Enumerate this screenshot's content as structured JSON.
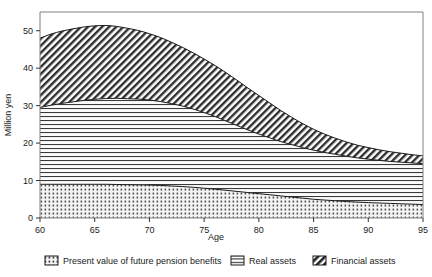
{
  "chart_data": {
    "type": "area",
    "title": "",
    "subtitle": "",
    "xlabel": "Age",
    "ylabel": "Million yen",
    "xlim": [
      60,
      95
    ],
    "ylim": [
      0,
      55
    ],
    "xticks": [
      60,
      65,
      70,
      75,
      80,
      85,
      90,
      95
    ],
    "yticks": [
      0,
      10,
      20,
      30,
      40,
      50
    ],
    "grid": false,
    "legend_position": "bottom",
    "stacked": true,
    "x": [
      60,
      61,
      62,
      63,
      64,
      65,
      66,
      67,
      68,
      69,
      70,
      71,
      72,
      73,
      74,
      75,
      76,
      77,
      78,
      79,
      80,
      81,
      82,
      83,
      84,
      85,
      86,
      87,
      88,
      89,
      90,
      91,
      92,
      93,
      94,
      95
    ],
    "series": [
      {
        "name": "Present value of future pension benefits",
        "pattern": "dots",
        "values": [
          9.0,
          9.0,
          9.0,
          9.0,
          9.0,
          9.0,
          9.0,
          8.95,
          8.9,
          8.85,
          8.8,
          8.7,
          8.55,
          8.4,
          8.2,
          7.95,
          7.7,
          7.4,
          7.1,
          6.8,
          6.5,
          6.2,
          5.9,
          5.6,
          5.3,
          5.0,
          4.8,
          4.6,
          4.4,
          4.25,
          4.1,
          4.0,
          3.9,
          3.8,
          3.7,
          3.6
        ]
      },
      {
        "name": "Real assets",
        "pattern": "horizontal-lines",
        "values": [
          20.5,
          21.1,
          21.6,
          22.0,
          22.4,
          22.7,
          22.9,
          23.0,
          22.95,
          22.9,
          22.7,
          22.4,
          22.0,
          21.5,
          20.9,
          20.2,
          19.4,
          18.5,
          17.6,
          16.7,
          15.9,
          15.2,
          14.5,
          14.0,
          13.5,
          13.1,
          12.7,
          12.4,
          12.1,
          11.8,
          11.6,
          11.4,
          11.2,
          11.1,
          11.0,
          10.9
        ]
      },
      {
        "name": "Financial assets",
        "pattern": "diagonal-hatch",
        "values": [
          18.5,
          19.0,
          19.3,
          19.5,
          19.6,
          19.6,
          19.5,
          19.2,
          18.8,
          18.3,
          17.7,
          17.1,
          16.4,
          15.7,
          15.0,
          14.3,
          13.6,
          12.9,
          12.1,
          11.2,
          10.3,
          9.3,
          8.3,
          7.3,
          6.4,
          5.6,
          4.9,
          4.3,
          3.8,
          3.4,
          3.1,
          2.8,
          2.6,
          2.4,
          2.2,
          2.1
        ]
      }
    ],
    "cumulative_top_values": {
      "pension_top": [
        9.0,
        9.0,
        9.0,
        9.0,
        9.0,
        9.0,
        9.0,
        8.95,
        8.9,
        8.85,
        8.8,
        8.7,
        8.55,
        8.4,
        8.2,
        7.95,
        7.7,
        7.4,
        7.1,
        6.8,
        6.5,
        6.2,
        5.9,
        5.6,
        5.3,
        5.0,
        4.8,
        4.6,
        4.4,
        4.25,
        4.1,
        4.0,
        3.9,
        3.8,
        3.7,
        3.6
      ],
      "real_top": [
        29.5,
        30.1,
        30.6,
        31.0,
        31.4,
        31.7,
        31.9,
        31.95,
        31.85,
        31.75,
        31.5,
        31.1,
        30.55,
        29.9,
        29.1,
        28.15,
        27.1,
        25.9,
        24.7,
        23.5,
        22.4,
        21.4,
        20.4,
        19.6,
        18.8,
        18.1,
        17.5,
        17.0,
        16.5,
        16.05,
        15.7,
        15.4,
        15.1,
        14.9,
        14.7,
        14.5
      ],
      "financial_top": [
        48.0,
        49.1,
        49.9,
        50.5,
        51.0,
        51.3,
        51.4,
        51.15,
        50.65,
        50.05,
        49.2,
        48.2,
        46.95,
        45.6,
        44.1,
        42.45,
        40.7,
        38.8,
        36.8,
        34.7,
        32.7,
        30.7,
        28.7,
        26.9,
        25.2,
        23.7,
        22.4,
        21.3,
        20.3,
        19.45,
        18.8,
        18.2,
        17.7,
        17.3,
        16.9,
        16.6
      ]
    }
  },
  "axes": {
    "y_label": "Million yen",
    "x_label": "Age",
    "y_tick_labels": [
      "0",
      "10",
      "20",
      "30",
      "40",
      "50"
    ],
    "x_tick_labels": [
      "60",
      "65",
      "70",
      "75",
      "80",
      "85",
      "90",
      "95"
    ]
  },
  "legend": {
    "items": [
      {
        "label": "Present value of future pension benefits",
        "pattern": "dots"
      },
      {
        "label": "Real assets",
        "pattern": "horizontal-lines"
      },
      {
        "label": "Financial assets",
        "pattern": "diagonal-hatch"
      }
    ]
  },
  "colors": {
    "background": "#ffffff",
    "axis": "#808080",
    "text": "#1a1a1a",
    "outline": "#1a1a1a",
    "pattern_fill": "#f2f2f2"
  }
}
